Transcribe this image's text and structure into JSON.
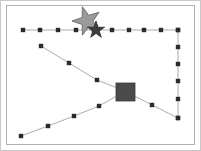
{
  "canvas": {
    "width": 201,
    "height": 151,
    "background_color": "#ffffff",
    "outer_border_color": "#c9c9c9",
    "inner_border_color": "#b0b0b0",
    "plot_background_color": "#ffffff"
  },
  "chart_data": {
    "type": "scatter",
    "title": "",
    "subtitle": "",
    "xlabel": "",
    "ylabel": "",
    "xlim": [
      0,
      201
    ],
    "ylim": [
      151,
      0
    ],
    "grid": false,
    "legend": null,
    "axis_ticks": [],
    "tick_labels": [],
    "annotations": [],
    "series": [
      {
        "name": "horizontal-path",
        "type": "line",
        "stroke_color": "#8a8a8a",
        "stroke_width": 0.7,
        "marker": "square",
        "marker_color": "#2b2b2b",
        "marker_size": 2.2,
        "points": [
          [
            23,
            30
          ],
          [
            40,
            30
          ],
          [
            58,
            30
          ],
          [
            76,
            30
          ],
          [
            94,
            30
          ],
          [
            112,
            30
          ],
          [
            129,
            30
          ],
          [
            144,
            30
          ],
          [
            161,
            30
          ],
          [
            178,
            30
          ]
        ]
      },
      {
        "name": "right-vertical-path",
        "type": "line",
        "stroke_color": "#8a8a8a",
        "stroke_width": 0.7,
        "marker": "square",
        "marker_color": "#2b2b2b",
        "marker_size": 2.2,
        "points": [
          [
            178,
            30
          ],
          [
            178,
            47
          ],
          [
            178,
            64
          ],
          [
            178,
            81
          ],
          [
            178,
            99
          ],
          [
            178,
            118
          ]
        ]
      },
      {
        "name": "upper-diagonal-path",
        "type": "line",
        "stroke_color": "#8a8a8a",
        "stroke_width": 0.7,
        "marker": "square",
        "marker_color": "#2b2b2b",
        "marker_size": 2.2,
        "points": [
          [
            41,
            46
          ],
          [
            69,
            63
          ],
          [
            97,
            80
          ],
          [
            125,
            91
          ],
          [
            152,
            105
          ],
          [
            178,
            118
          ]
        ]
      },
      {
        "name": "lower-diagonal-path",
        "type": "line",
        "stroke_color": "#8a8a8a",
        "stroke_width": 0.7,
        "marker": "square",
        "marker_color": "#2b2b2b",
        "marker_size": 2.2,
        "points": [
          [
            21,
            136
          ],
          [
            48,
            126
          ],
          [
            74,
            116
          ],
          [
            99,
            106
          ],
          [
            124,
            92
          ]
        ]
      }
    ],
    "shapes": [
      {
        "name": "large-star",
        "type": "star",
        "points": 5,
        "center": [
          87,
          21
        ],
        "outer_radius": 15,
        "inner_radius": 6,
        "rotation_deg": -18,
        "fill_color": "#9a9a9a",
        "stroke_color": "#5e5e5e",
        "stroke_width": 0.8
      },
      {
        "name": "small-star",
        "type": "star",
        "points": 5,
        "center": [
          96,
          30
        ],
        "outer_radius": 9,
        "inner_radius": 3.4,
        "rotation_deg": 72,
        "fill_color": "#3c3c3c",
        "stroke_color": "#2a2a2a",
        "stroke_width": 0.8
      },
      {
        "name": "square-marker",
        "type": "rect",
        "x": 116,
        "y": 83,
        "width": 19,
        "height": 18,
        "fill_color": "#4a4a4a",
        "stroke_color": "#3a3a3a",
        "stroke_width": 0.8
      }
    ]
  }
}
